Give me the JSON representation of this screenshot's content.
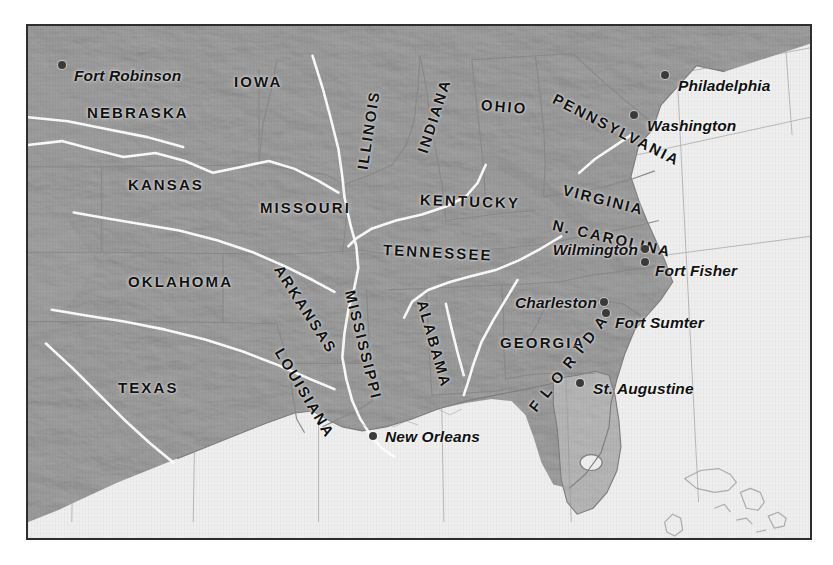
{
  "map": {
    "title": "Civil War Era United States Map",
    "frame": {
      "x": 26,
      "y": 24,
      "width": 786,
      "height": 516,
      "border_color": "#2e2e2e"
    },
    "colors": {
      "ocean": "#efefef",
      "land": "#c5c5c5",
      "land_shadow": "#a8a8a8",
      "land_highlight": "#dcdcdc",
      "river": "#ffffff",
      "state_border": "#8d8d8d",
      "coastline": "#7b7b7b",
      "graticule": "#9a9a9a",
      "label": "#111111",
      "dot": "#3a3a3a",
      "page": "#ffffff"
    },
    "state_labels": [
      {
        "name": "IOWA",
        "text": "IOWA",
        "x": 232,
        "y": 72,
        "rotate": 0,
        "size": "normal"
      },
      {
        "name": "NEBRASKA",
        "text": "NEBRASKA",
        "x": 85,
        "y": 103,
        "rotate": 0,
        "size": "normal"
      },
      {
        "name": "KANSAS",
        "text": "KANSAS",
        "x": 126,
        "y": 175,
        "rotate": 0,
        "size": "normal"
      },
      {
        "name": "MISSOURI",
        "text": "MISSOURI",
        "x": 258,
        "y": 198,
        "rotate": 0,
        "size": "normal"
      },
      {
        "name": "OKLAHOMA",
        "text": "OKLAHOMA",
        "x": 126,
        "y": 272,
        "rotate": 0,
        "size": "normal"
      },
      {
        "name": "TEXAS",
        "text": "TEXAS",
        "x": 116,
        "y": 378,
        "rotate": 0,
        "size": "normal"
      },
      {
        "name": "ILLINOIS",
        "text": "ILLINOIS",
        "x": 360,
        "y": 160,
        "rotate": 81,
        "size": "normal"
      },
      {
        "name": "INDIANA",
        "text": "INDIANA",
        "x": 420,
        "y": 143,
        "rotate": 72,
        "size": "normal"
      },
      {
        "name": "OHIO",
        "text": "OHIO",
        "x": 479,
        "y": 95,
        "rotate": -5,
        "size": "normal"
      },
      {
        "name": "PENNSYLVANIA",
        "text": "PENNSYLVANIA",
        "x": 552,
        "y": 88,
        "rotate": -27,
        "size": "normal"
      },
      {
        "name": "KENTUCKY",
        "text": "KENTUCKY",
        "x": 418,
        "y": 190,
        "rotate": -2,
        "size": "normal"
      },
      {
        "name": "TENNESSEE",
        "text": "TENNESSEE",
        "x": 381,
        "y": 240,
        "rotate": -3,
        "size": "normal"
      },
      {
        "name": "VIRGINIA",
        "text": "VIRGINIA",
        "x": 561,
        "y": 180,
        "rotate": -14,
        "size": "normal"
      },
      {
        "name": "N-CAROLINA",
        "text": "N. CAROLINA",
        "x": 551,
        "y": 215,
        "rotate": -13,
        "size": "normal"
      },
      {
        "name": "ARKANSAS",
        "text": "ARKANSAS",
        "x": 276,
        "y": 257,
        "rotate": -57,
        "size": "normal"
      },
      {
        "name": "LOUISIANA",
        "text": "LOUISIANA",
        "x": 277,
        "y": 340,
        "rotate": -59,
        "size": "normal"
      },
      {
        "name": "MISSISSIPPI",
        "text": "MISSISSIPPI",
        "x": 348,
        "y": 281,
        "rotate": -76,
        "size": "normal"
      },
      {
        "name": "ALABAMA",
        "text": "ALABAMA",
        "x": 420,
        "y": 291,
        "rotate": -74,
        "size": "normal"
      },
      {
        "name": "GEORGIA",
        "text": "GEORGIA",
        "x": 498,
        "y": 333,
        "rotate": 0,
        "size": "normal"
      },
      {
        "name": "FLORIDA",
        "text": "F L O R I D A",
        "x": 530,
        "y": 400,
        "rotate": 52,
        "size": "normal"
      }
    ],
    "cities": [
      {
        "name": "fort-robinson",
        "text": "Fort Robinson",
        "dot_x": 60,
        "dot_y": 63,
        "label_x": 72,
        "label_y": 74,
        "anchor": "left"
      },
      {
        "name": "philadelphia",
        "text": "Philadelphia",
        "dot_x": 663,
        "dot_y": 73,
        "label_x": 676,
        "label_y": 84,
        "anchor": "left"
      },
      {
        "name": "washington",
        "text": "Washington",
        "dot_x": 632,
        "dot_y": 113,
        "label_x": 645,
        "label_y": 124,
        "anchor": "left"
      },
      {
        "name": "wilmington",
        "text": "Wilmington",
        "dot_x": 643,
        "dot_y": 247,
        "label_x": 636,
        "label_y": 248,
        "anchor": "right"
      },
      {
        "name": "fort-fisher",
        "text": "Fort Fisher",
        "dot_x": 643,
        "dot_y": 260,
        "label_x": 653,
        "label_y": 269,
        "anchor": "left"
      },
      {
        "name": "charleston",
        "text": "Charleston",
        "dot_x": 602,
        "dot_y": 300,
        "label_x": 595,
        "label_y": 301,
        "anchor": "right"
      },
      {
        "name": "fort-sumter",
        "text": "Fort Sumter",
        "dot_x": 604,
        "dot_y": 311,
        "label_x": 613,
        "label_y": 321,
        "anchor": "left"
      },
      {
        "name": "st-augustine",
        "text": "St. Augustine",
        "dot_x": 578,
        "dot_y": 381,
        "label_x": 591,
        "label_y": 387,
        "anchor": "left"
      },
      {
        "name": "new-orleans",
        "text": "New Orleans",
        "dot_x": 371,
        "dot_y": 434,
        "label_x": 383,
        "label_y": 435,
        "anchor": "left"
      }
    ]
  }
}
